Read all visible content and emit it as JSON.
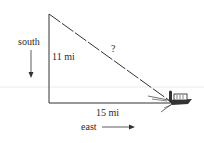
{
  "diagram": {
    "type": "right-triangle-word-problem",
    "labels": {
      "direction_vertical": "south",
      "direction_horizontal": "east",
      "vertical_leg": "11 mi",
      "horizontal_leg": "15 mi",
      "hypotenuse": "?"
    },
    "legs": {
      "vertical_miles": 11,
      "horizontal_miles": 15
    },
    "icons": [
      "down-arrow-icon",
      "right-arrow-icon",
      "boat-icon"
    ],
    "colors": {
      "line": "#333333",
      "text": "#2a2a2a",
      "background": "#ffffff",
      "faint_line": "#e6e6e6"
    }
  }
}
